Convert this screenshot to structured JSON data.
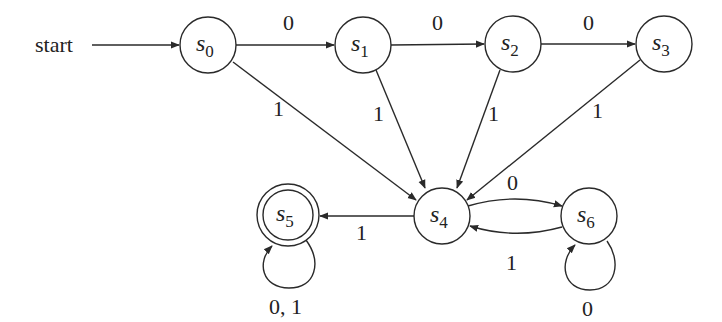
{
  "diagram": {
    "type": "finite-state-machine",
    "start_label": "start",
    "states": [
      {
        "id": "s0",
        "name": "s",
        "sub": "0",
        "x": 208,
        "y": 45,
        "accepting": false,
        "initial": true
      },
      {
        "id": "s1",
        "name": "s",
        "sub": "1",
        "x": 363,
        "y": 45,
        "accepting": false,
        "initial": false
      },
      {
        "id": "s2",
        "name": "s",
        "sub": "2",
        "x": 513,
        "y": 44,
        "accepting": false,
        "initial": false
      },
      {
        "id": "s3",
        "name": "s",
        "sub": "3",
        "x": 664,
        "y": 44,
        "accepting": false,
        "initial": false
      },
      {
        "id": "s4",
        "name": "s",
        "sub": "4",
        "x": 442,
        "y": 216,
        "accepting": false,
        "initial": false
      },
      {
        "id": "s5",
        "name": "s",
        "sub": "5",
        "x": 288,
        "y": 215,
        "accepting": true,
        "initial": false
      },
      {
        "id": "s6",
        "name": "s",
        "sub": "6",
        "x": 589,
        "y": 216,
        "accepting": false,
        "initial": false
      }
    ],
    "transitions": [
      {
        "from": "s0",
        "to": "s1",
        "label": "0"
      },
      {
        "from": "s1",
        "to": "s2",
        "label": "0"
      },
      {
        "from": "s2",
        "to": "s3",
        "label": "0"
      },
      {
        "from": "s0",
        "to": "s4",
        "label": "1"
      },
      {
        "from": "s1",
        "to": "s4",
        "label": "1"
      },
      {
        "from": "s2",
        "to": "s4",
        "label": "1"
      },
      {
        "from": "s3",
        "to": "s4",
        "label": "1"
      },
      {
        "from": "s4",
        "to": "s5",
        "label": "1"
      },
      {
        "from": "s4",
        "to": "s6",
        "label": "0"
      },
      {
        "from": "s6",
        "to": "s4",
        "label": "1"
      },
      {
        "from": "s5",
        "to": "s5",
        "label": "0, 1"
      },
      {
        "from": "s6",
        "to": "s6",
        "label": "0"
      }
    ],
    "colors": {
      "stroke": "#2a2a2a",
      "text": "#222222",
      "background": "#ffffff"
    }
  }
}
